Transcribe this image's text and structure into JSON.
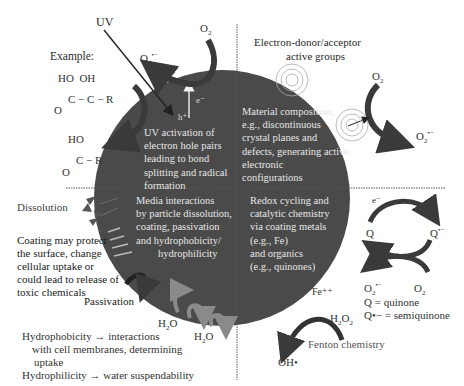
{
  "diagram": {
    "center": "nanoparticle sphere",
    "colors": {
      "sphere": "#4a4a4a",
      "arrow_dark": "#3a3a3a",
      "arrow_gray": "#8a8a8a",
      "sphere_text": "#e6e6e6",
      "divider": "#555555"
    },
    "quadrants": {
      "top_left": {
        "lines": [
          "UV activation of",
          "electron hole pairs",
          "leading to bond",
          "splitting and radical",
          "formation"
        ]
      },
      "top_right": {
        "lines": [
          "Material composition,",
          "e.g., discontinuous",
          "crystal planes and",
          "defects, generating active",
          "electronic",
          "configurations"
        ]
      },
      "bottom_left": {
        "lines": [
          "Media interactions",
          "by particle dissolution,",
          "coating, passivation",
          "and hydrophobicity/",
          "hydrophilicity"
        ]
      },
      "bottom_right": {
        "lines": [
          "Redox cycling and",
          "catalytic chemistry",
          "via coating metals",
          "(e.g., Fe)",
          "and organics",
          "(e.g., quinones)"
        ]
      }
    },
    "labels": {
      "uv": "UV",
      "example": "Example:",
      "o2_top": "O",
      "o2_top_sub": "2",
      "o2_radical_top": "O",
      "o2_radical_top_sub": "2",
      "o2_radical_top_sup": "•−",
      "e_minus_uv": "e⁻",
      "h_plus": "h⁺",
      "donor_title_1": "Electron-donor/acceptor",
      "donor_title_2": "active groups",
      "o2_right": "O",
      "o2_right_sub": "2",
      "e_minus_right": "e⁻",
      "o2_radical_right": "O",
      "o2_radical_right_sub": "2",
      "o2_radical_right_sup": "•−",
      "dissolution": "Dissolution",
      "coating_1": "Coating may protect",
      "coating_2": "the surface, change",
      "coating_3": "cellular uptake or",
      "coating_4": "could lead to release of",
      "coating_5": "toxic chemicals",
      "passivation": "Passivation",
      "h2o_1": "H",
      "h2o_1_sub": "2",
      "h2o_1_end": "O",
      "h2o_2": "H",
      "h2o_2_sub": "2",
      "h2o_2_end": "O",
      "hydrophobicity_1": "Hydrophobicity → interactions",
      "hydrophobicity_2": "with cell membranes, determining",
      "hydrophobicity_3": "uptake",
      "hydrophilicity": "Hydrophilicity → water suspendability",
      "e_minus_q": "e⁻",
      "q": "Q",
      "q_radical": "Q",
      "q_radical_sup": "•−",
      "o2_radical_q": "O",
      "o2_radical_q_sub": "2",
      "o2_radical_q_sup": "•−",
      "o2_q": "O",
      "o2_q_sub": "2",
      "q_def": "Q = quinone",
      "q_radical_def": "Q•− = semiquinone",
      "fe": "Fe⁺⁺",
      "h2o2": "H",
      "h2o2_sub": "2",
      "h2o2_mid": "O",
      "h2o2_sub2": "2",
      "oh": "OH•",
      "fenton": "Fenton chemistry"
    },
    "molecules": {
      "m1_ho": "HO",
      "m1_oh": "OH",
      "m1_chain": "C − C − R",
      "m1_o": "O",
      "m2_ho": "HO",
      "m2_chain": "C − R",
      "m2_o": "O"
    }
  }
}
